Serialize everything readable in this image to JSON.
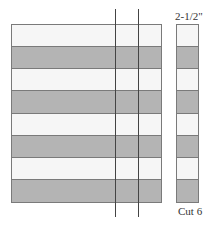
{
  "diagram": {
    "title": "",
    "colors": {
      "light_band": "#f6f6f6",
      "dark_band": "#b4b4b4",
      "border": "#7a7a7a",
      "cut_line": "#444444"
    },
    "strip_set": {
      "band_count": 8,
      "bands": [
        "light",
        "dark",
        "light",
        "dark",
        "light",
        "dark",
        "light",
        "dark"
      ]
    },
    "cut_lines": {
      "count": 2
    },
    "cut_strip": {
      "width_label": "2-1/2\"",
      "count_label": "Cut 6"
    }
  }
}
